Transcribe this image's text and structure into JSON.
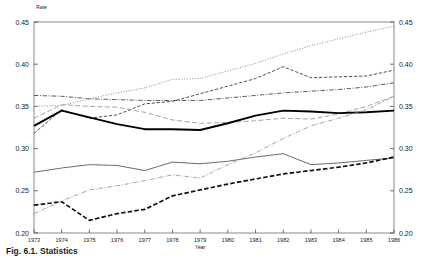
{
  "figure": {
    "caption": "Fig. 6.1.  Statistics",
    "y_axis_title": "Rate",
    "x_axis_title": "Year"
  },
  "chart_data": {
    "type": "line",
    "title": "",
    "xlabel": "Year",
    "ylabel": "Rate",
    "xlim": [
      1973,
      1986
    ],
    "ylim": [
      0.2,
      0.45
    ],
    "grid": false,
    "legend": "none",
    "dual_y_axis": true,
    "y_ticks": [
      "0.20",
      "0.25",
      "0.30",
      "0.35",
      "0.40",
      "0.45"
    ],
    "y_tick_values": [
      0.2,
      0.25,
      0.3,
      0.35,
      0.4,
      0.45
    ],
    "x": [
      1973,
      1974,
      1975,
      1976,
      1977,
      1978,
      1979,
      1980,
      1981,
      1982,
      1983,
      1984,
      1985,
      1986
    ],
    "x_tick_labels": [
      "1973",
      "1974",
      "1975",
      "1976",
      "1977",
      "1978",
      "1979",
      "1980",
      "1981",
      "1982",
      "1983",
      "1984",
      "1985",
      "1986"
    ],
    "series": [
      {
        "name": "Series A (dotted, top)",
        "style": "dotted",
        "color": "#8a8a8a",
        "width": 1.0,
        "values": [
          0.35,
          0.351,
          0.359,
          0.366,
          0.372,
          0.382,
          0.383,
          0.392,
          0.401,
          0.412,
          0.422,
          0.43,
          0.438,
          0.445
        ]
      },
      {
        "name": "Series B (dashed)",
        "style": "dashed",
        "color": "#3a3a3a",
        "width": 0.9,
        "values": [
          0.318,
          0.346,
          0.336,
          0.34,
          0.353,
          0.356,
          0.365,
          0.374,
          0.383,
          0.397,
          0.384,
          0.385,
          0.386,
          0.393
        ]
      },
      {
        "name": "Series C (dash-dot, upper)",
        "style": "dashdot",
        "color": "#4a4a4a",
        "width": 0.9,
        "values": [
          0.363,
          0.362,
          0.359,
          0.358,
          0.357,
          0.357,
          0.357,
          0.36,
          0.363,
          0.366,
          0.368,
          0.37,
          0.373,
          0.378
        ]
      },
      {
        "name": "Series D (long dash, rising)",
        "style": "longdash",
        "color": "#9a9a9a",
        "width": 0.9,
        "values": [
          0.336,
          0.352,
          0.35,
          0.349,
          0.343,
          0.334,
          0.33,
          0.331,
          0.333,
          0.336,
          0.335,
          0.341,
          0.35,
          0.362
        ]
      },
      {
        "name": "Series E (bold solid)",
        "style": "solid",
        "color": "#000000",
        "width": 1.9,
        "values": [
          0.327,
          0.345,
          0.337,
          0.329,
          0.323,
          0.323,
          0.322,
          0.33,
          0.339,
          0.345,
          0.344,
          0.342,
          0.343,
          0.345
        ]
      },
      {
        "name": "Series F (thin solid, lower)",
        "style": "solid",
        "color": "#5a5a5a",
        "width": 0.9,
        "values": [
          0.272,
          0.277,
          0.281,
          0.28,
          0.274,
          0.284,
          0.282,
          0.285,
          0.29,
          0.294,
          0.281,
          0.283,
          0.286,
          0.289
        ]
      },
      {
        "name": "Series G (bold dashed, bottom)",
        "style": "bolddash",
        "color": "#111111",
        "width": 1.7,
        "values": [
          0.233,
          0.237,
          0.215,
          0.223,
          0.228,
          0.244,
          0.251,
          0.258,
          0.264,
          0.27,
          0.274,
          0.278,
          0.283,
          0.29
        ]
      },
      {
        "name": "Series H (dash-dot, lower rising)",
        "style": "dashdot",
        "color": "#9a9a9a",
        "width": 0.9,
        "values": [
          0.223,
          0.238,
          0.251,
          0.256,
          0.262,
          0.269,
          0.265,
          0.281,
          0.295,
          0.312,
          0.327,
          0.336,
          0.346,
          0.362
        ]
      }
    ]
  }
}
